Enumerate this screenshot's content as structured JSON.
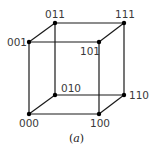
{
  "diagram": {
    "type": "binary-cube",
    "caption": {
      "open": "(",
      "letter": "a",
      "close": ")"
    },
    "vertices": [
      {
        "id": "000",
        "label": "000",
        "x": 29,
        "y": 114,
        "lx": 19,
        "ly": 127
      },
      {
        "id": "001",
        "label": "001",
        "x": 29,
        "y": 42,
        "lx": 7,
        "ly": 46
      },
      {
        "id": "010",
        "label": "010",
        "x": 55,
        "y": 95,
        "lx": 61,
        "ly": 92
      },
      {
        "id": "011",
        "label": "011",
        "x": 55,
        "y": 23,
        "lx": 45,
        "ly": 18
      },
      {
        "id": "100",
        "label": "100",
        "x": 99,
        "y": 114,
        "lx": 90,
        "ly": 127
      },
      {
        "id": "101",
        "label": "101",
        "x": 99,
        "y": 42,
        "lx": 80,
        "ly": 55
      },
      {
        "id": "110",
        "label": "110",
        "x": 124,
        "y": 95,
        "lx": 129,
        "ly": 99
      },
      {
        "id": "111",
        "label": "111",
        "x": 124,
        "y": 23,
        "lx": 115,
        "ly": 18
      }
    ],
    "edges": [
      [
        "000",
        "001"
      ],
      [
        "000",
        "010"
      ],
      [
        "000",
        "100"
      ],
      [
        "001",
        "011"
      ],
      [
        "001",
        "101"
      ],
      [
        "010",
        "011"
      ],
      [
        "010",
        "110"
      ],
      [
        "100",
        "101"
      ],
      [
        "100",
        "110"
      ],
      [
        "011",
        "111"
      ],
      [
        "101",
        "111"
      ],
      [
        "110",
        "111"
      ]
    ]
  }
}
